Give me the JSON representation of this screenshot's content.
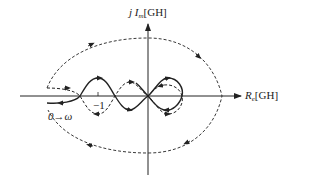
{
  "diagram": {
    "type": "nyquist-plot",
    "axes": {
      "y_label_prefix": "j",
      "y_label_main": "I",
      "y_label_sub": "m",
      "y_label_unit": "[GH]",
      "x_label_main": "R",
      "x_label_sub": "e",
      "x_label_unit": "[GH]"
    },
    "tick_label": "−1",
    "frequency_label": {
      "start": "0",
      "arrow": "→",
      "end": "ω"
    },
    "colors": {
      "stroke": "#222222",
      "background": "#ffffff"
    },
    "curves": [
      {
        "name": "solid-nyquist-curve",
        "style": "solid"
      },
      {
        "name": "dashed-mirror-curve",
        "style": "dashed"
      },
      {
        "name": "dashed-infinite-semicircle",
        "style": "dashed"
      }
    ]
  }
}
